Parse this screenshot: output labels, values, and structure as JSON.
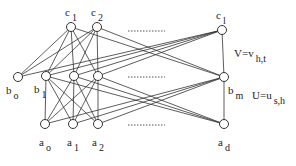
{
  "diagram": {
    "colors": {
      "line": "#333333",
      "node_fill": "#ffffff",
      "dots": "#555555"
    },
    "nodes": {
      "c1": {
        "x": 71,
        "y": 27,
        "label": "c",
        "sub": "1"
      },
      "c2": {
        "x": 97,
        "y": 27,
        "label": "c",
        "sub": "2"
      },
      "cl": {
        "x": 222,
        "y": 30,
        "label": "c",
        "sub": "l"
      },
      "b0": {
        "x": 18,
        "y": 77,
        "label": "b",
        "sub": "o"
      },
      "b1": {
        "x": 46,
        "y": 76,
        "label": "b",
        "sub": "1"
      },
      "b2": {
        "x": 74,
        "y": 76
      },
      "b3": {
        "x": 98,
        "y": 76
      },
      "bm": {
        "x": 224,
        "y": 77,
        "label": "b",
        "sub": "m"
      },
      "a0": {
        "x": 45,
        "y": 124,
        "label": "a",
        "sub": "o"
      },
      "a1": {
        "x": 73,
        "y": 124,
        "label": "a",
        "sub": "1"
      },
      "a2": {
        "x": 98,
        "y": 124,
        "label": "a",
        "sub": "2"
      },
      "ad": {
        "x": 224,
        "y": 124,
        "label": "a",
        "sub": "d"
      }
    },
    "annotations": {
      "v_eq": {
        "main": "V=v",
        "sub": "h,t"
      },
      "u_eq": {
        "main": "U=u",
        "sub": "s,h"
      }
    },
    "dotted_rows_y": [
      31,
      77,
      125
    ]
  }
}
